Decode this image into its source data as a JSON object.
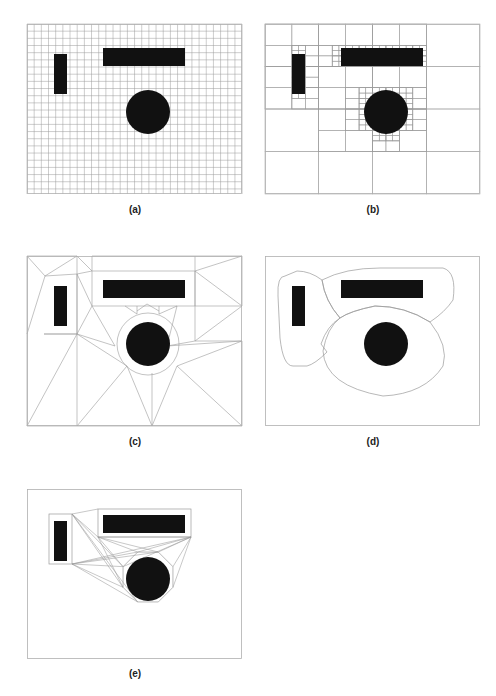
{
  "figure": {
    "panels": [
      {
        "id": "a",
        "label": "(a)",
        "method": "uniform grid decomposition",
        "x": 27,
        "y": 24,
        "label_y": 204
      },
      {
        "id": "b",
        "label": "(b)",
        "method": "quadtree decomposition",
        "x": 265,
        "y": 24,
        "label_y": 204
      },
      {
        "id": "c",
        "label": "(c)",
        "method": "triangulation of free space",
        "x": 27,
        "y": 256,
        "label_y": 436
      },
      {
        "id": "d",
        "label": "(d)",
        "method": "free-space regions",
        "x": 265,
        "y": 256,
        "label_y": 436
      },
      {
        "id": "e",
        "label": "(e)",
        "method": "visibility graph",
        "x": 27,
        "y": 489,
        "label_y": 668
      }
    ],
    "frame": {
      "width": 215,
      "height": 170
    },
    "obstacles": {
      "vertical_bar": {
        "x": 27,
        "y": 30,
        "w": 13,
        "h": 40
      },
      "horizontal_bar": {
        "x": 76,
        "y": 24,
        "w": 82,
        "h": 18
      },
      "disk": {
        "cx": 121,
        "cy": 88,
        "r": 22
      }
    },
    "colors": {
      "obstacle": "#111111",
      "line": "#9a9a9a",
      "frame": "#b0b0b0"
    },
    "grid_spacing": 7.17
  }
}
